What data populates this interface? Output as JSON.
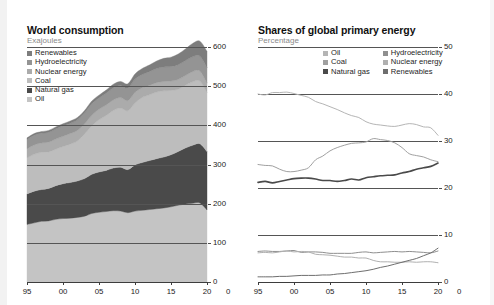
{
  "page": {
    "background": "#ffffff",
    "width": 494,
    "height": 305
  },
  "left_panel": {
    "title": "World consumption",
    "subtitle": "Exajoules",
    "legend": [
      {
        "label": "Renewables",
        "color": "#7d7d7d"
      },
      {
        "label": "Hydroelectricity",
        "color": "#949494"
      },
      {
        "label": "Nuclear energy",
        "color": "#ababab"
      },
      {
        "label": "Coal",
        "color": "#bdbdbd"
      },
      {
        "label": "Natural gas",
        "color": "#4a4a4a"
      },
      {
        "label": "Oil",
        "color": "#c4c4c4"
      }
    ]
  },
  "right_panel": {
    "title": "Shares of global primary energy",
    "subtitle": "Percentage",
    "legend_col1": [
      {
        "label": "Oil",
        "color": "#b5b5b5"
      },
      {
        "label": "Coal",
        "color": "#a0a0a0"
      },
      {
        "label": "Natural gas",
        "color": "#4a4a4a"
      }
    ],
    "legend_col2": [
      {
        "label": "Hydroelectricity",
        "color": "#8f8f8f"
      },
      {
        "label": "Nuclear energy",
        "color": "#b0b0b0"
      },
      {
        "label": "Renewables",
        "color": "#6e6e6e"
      }
    ]
  },
  "chart_data": [
    {
      "id": "world-consumption",
      "type": "area",
      "stacked": true,
      "title": "World consumption",
      "subtitle": "Exajoules",
      "xlabel": "",
      "ylabel": "Exajoules",
      "y_axis_side": "right",
      "ylim": [
        0,
        600
      ],
      "yticks": [
        0,
        100,
        200,
        300,
        400,
        500,
        600
      ],
      "ytick_labels": [
        "0",
        "100",
        "200",
        "300",
        "400",
        "500",
        "600"
      ],
      "xlim": [
        1995,
        2020
      ],
      "xticks": [
        1995,
        2000,
        2005,
        2010,
        2015,
        2020
      ],
      "xtick_labels": [
        "95",
        "00",
        "05",
        "10",
        "15",
        "20"
      ],
      "grid": true,
      "legend_position": "upper-left-inside",
      "x": [
        1995,
        1996,
        1997,
        1998,
        1999,
        2000,
        2001,
        2002,
        2003,
        2004,
        2005,
        2006,
        2007,
        2008,
        2009,
        2010,
        2011,
        2012,
        2013,
        2014,
        2015,
        2016,
        2017,
        2018,
        2019,
        2020
      ],
      "series": [
        {
          "name": "Oil",
          "color": "#c4c4c4",
          "values": [
            147,
            151,
            155,
            156,
            160,
            162,
            163,
            165,
            168,
            175,
            178,
            180,
            182,
            181,
            177,
            181,
            183,
            185,
            187,
            189,
            192,
            196,
            199,
            201,
            202,
            184
          ]
        },
        {
          "name": "Natural gas",
          "color": "#4a4a4a",
          "values": [
            78,
            81,
            81,
            83,
            86,
            89,
            91,
            93,
            96,
            100,
            103,
            105,
            109,
            112,
            110,
            118,
            122,
            125,
            128,
            130,
            133,
            137,
            143,
            148,
            151,
            149
          ]
        },
        {
          "name": "Coal",
          "color": "#bdbdbd",
          "values": [
            92,
            94,
            95,
            93,
            93,
            95,
            98,
            102,
            114,
            124,
            133,
            140,
            147,
            151,
            150,
            158,
            166,
            168,
            170,
            169,
            164,
            159,
            160,
            162,
            160,
            151
          ]
        },
        {
          "name": "Nuclear energy",
          "color": "#ababab",
          "values": [
            23,
            24,
            24,
            25,
            26,
            26,
            27,
            27,
            26,
            27,
            27,
            27,
            27,
            27,
            26,
            27,
            25,
            24,
            24,
            24,
            24,
            25,
            25,
            26,
            26,
            24
          ]
        },
        {
          "name": "Hydroelectricity",
          "color": "#949494",
          "values": [
            24,
            25,
            25,
            25,
            26,
            27,
            26,
            27,
            28,
            29,
            29,
            30,
            31,
            31,
            32,
            34,
            34,
            35,
            36,
            37,
            37,
            38,
            38,
            38,
            38,
            39
          ]
        },
        {
          "name": "Renewables",
          "color": "#7d7d7d",
          "values": [
            4,
            4,
            4,
            5,
            5,
            5,
            6,
            6,
            6,
            7,
            7,
            8,
            9,
            10,
            11,
            13,
            15,
            17,
            19,
            22,
            24,
            27,
            30,
            34,
            38,
            42
          ]
        }
      ],
      "totals": [
        368,
        379,
        384,
        387,
        396,
        404,
        411,
        420,
        438,
        462,
        477,
        490,
        505,
        512,
        506,
        531,
        545,
        554,
        564,
        571,
        574,
        582,
        595,
        609,
        615,
        589
      ],
      "annotations": [
        "Total peaks near 615 EJ in 2019, falls to about 589 EJ in 2020"
      ]
    },
    {
      "id": "shares-of-global-primary-energy",
      "type": "line",
      "title": "Shares of global primary energy",
      "subtitle": "Percentage",
      "xlabel": "",
      "ylabel": "Percentage",
      "y_axis_side": "right",
      "ylim": [
        0,
        50
      ],
      "yticks": [
        0,
        10,
        20,
        30,
        40,
        50
      ],
      "ytick_labels": [
        "0",
        "10",
        "20",
        "30",
        "40",
        "50"
      ],
      "xlim": [
        1995,
        2020
      ],
      "xticks": [
        1995,
        2000,
        2005,
        2010,
        2015,
        2020
      ],
      "xtick_labels": [
        "95",
        "00",
        "05",
        "10",
        "15",
        "20"
      ],
      "grid": true,
      "legend_position": "top-right",
      "x": [
        1995,
        1996,
        1997,
        1998,
        1999,
        2000,
        2001,
        2002,
        2003,
        2004,
        2005,
        2006,
        2007,
        2008,
        2009,
        2010,
        2011,
        2012,
        2013,
        2014,
        2015,
        2016,
        2017,
        2018,
        2019,
        2020
      ],
      "series": [
        {
          "name": "Oil",
          "color": "#b5b5b5",
          "values": [
            40.0,
            39.8,
            40.3,
            40.3,
            40.4,
            40.1,
            39.7,
            39.3,
            38.4,
            37.9,
            37.3,
            36.7,
            36.0,
            35.4,
            35.0,
            34.1,
            33.6,
            33.4,
            33.2,
            33.1,
            33.4,
            33.7,
            33.5,
            33.0,
            32.8,
            31.2
          ]
        },
        {
          "name": "Coal",
          "color": "#a0a0a0",
          "values": [
            25.0,
            24.8,
            24.7,
            24.0,
            23.5,
            23.5,
            23.8,
            24.3,
            26.0,
            26.8,
            27.9,
            28.6,
            29.1,
            29.5,
            29.6,
            29.8,
            30.5,
            30.3,
            30.1,
            29.6,
            28.6,
            27.3,
            26.9,
            26.6,
            26.0,
            25.6
          ]
        },
        {
          "name": "Natural gas",
          "color": "#4a4a4a",
          "values": [
            21.2,
            21.4,
            21.1,
            21.4,
            21.7,
            22.0,
            22.1,
            22.1,
            21.9,
            21.6,
            21.6,
            21.4,
            21.6,
            21.9,
            21.7,
            22.2,
            22.4,
            22.6,
            22.7,
            22.8,
            23.2,
            23.5,
            24.0,
            24.3,
            24.6,
            25.3
          ]
        },
        {
          "name": "Hydroelectricity",
          "color": "#8f8f8f",
          "values": [
            6.5,
            6.6,
            6.5,
            6.5,
            6.6,
            6.7,
            6.3,
            6.4,
            6.4,
            6.3,
            6.1,
            6.1,
            6.1,
            6.1,
            6.3,
            6.4,
            6.2,
            6.3,
            6.4,
            6.5,
            6.4,
            6.5,
            6.4,
            6.3,
            6.2,
            6.6
          ]
        },
        {
          "name": "Nuclear energy",
          "color": "#b0b0b0",
          "values": [
            6.2,
            6.3,
            6.2,
            6.4,
            6.6,
            6.4,
            6.5,
            6.4,
            5.9,
            5.8,
            5.7,
            5.5,
            5.3,
            5.3,
            5.1,
            5.1,
            4.6,
            4.3,
            4.3,
            4.2,
            4.2,
            4.3,
            4.2,
            4.3,
            4.3,
            4.1
          ]
        },
        {
          "name": "Renewables",
          "color": "#6e6e6e",
          "values": [
            1.1,
            1.1,
            1.1,
            1.2,
            1.2,
            1.3,
            1.4,
            1.4,
            1.4,
            1.5,
            1.5,
            1.7,
            1.8,
            2.0,
            2.2,
            2.4,
            2.7,
            3.1,
            3.4,
            3.8,
            4.2,
            4.6,
            5.0,
            5.6,
            6.2,
            7.2
          ]
        }
      ]
    }
  ]
}
